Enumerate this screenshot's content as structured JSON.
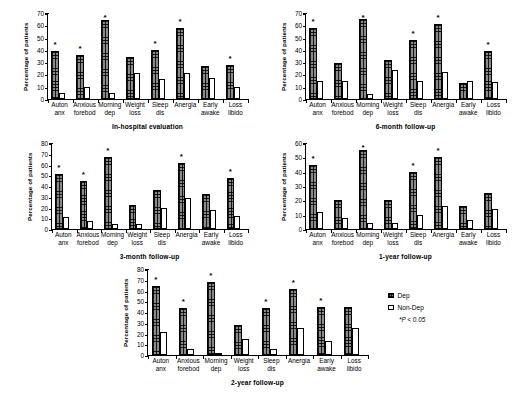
{
  "figure": {
    "ylabel": "Percentage of patients",
    "categories": [
      "Auton anx",
      "Anxious forebod",
      "Morning dep",
      "Weight loss",
      "Sleep dis",
      "Anergia",
      "Early awake",
      "Loss libido"
    ],
    "category_lines": [
      [
        "Auton",
        "anx"
      ],
      [
        "Anxious",
        "forebod"
      ],
      [
        "Morning",
        "dep"
      ],
      [
        "Weight",
        "loss"
      ],
      [
        "Sleep",
        "dis"
      ],
      [
        "Anergia",
        ""
      ],
      [
        "Early",
        "awake"
      ],
      [
        "Loss",
        "libido"
      ]
    ]
  },
  "legend": {
    "items": [
      {
        "label": "Dep",
        "swatch": "dep"
      },
      {
        "label": "Non-Dep",
        "swatch": "nondep"
      }
    ],
    "pnote_star": "*",
    "pnote_text": "P < 0.05"
  },
  "chart_data": [
    {
      "id": "in-hospital",
      "type": "bar",
      "title": "In-hospital evaluation",
      "xlabel": "In-hospital evaluation",
      "ylabel": "Percentage of patients",
      "ylim": [
        0,
        70
      ],
      "yticks": [
        0,
        10,
        20,
        30,
        40,
        50,
        60,
        70
      ],
      "grid": false,
      "categories": [
        "Auton anx",
        "Anxious forebod",
        "Morning dep",
        "Weight loss",
        "Sleep dis",
        "Anergia",
        "Early awake",
        "Loss libido"
      ],
      "series": [
        {
          "name": "Dep",
          "values": [
            39,
            36,
            64,
            34,
            40,
            58,
            27,
            28
          ]
        },
        {
          "name": "Non-Dep",
          "values": [
            5,
            10,
            5,
            21,
            16,
            21,
            17,
            10
          ]
        }
      ],
      "significant": [
        true,
        true,
        true,
        false,
        true,
        true,
        false,
        true
      ]
    },
    {
      "id": "6-month",
      "type": "bar",
      "title": "6-month follow-up",
      "xlabel": "6-month follow-up",
      "ylabel": "Percentage of patients",
      "ylim": [
        0,
        70
      ],
      "yticks": [
        0,
        10,
        20,
        30,
        40,
        50,
        60,
        70
      ],
      "grid": false,
      "categories": [
        "Auton anx",
        "Anxious forebod",
        "Morning dep",
        "Weight loss",
        "Sleep dis",
        "Anergia",
        "Early awake",
        "Loss libido"
      ],
      "series": [
        {
          "name": "Dep",
          "values": [
            58,
            29,
            65,
            32,
            48,
            61,
            13,
            39
          ]
        },
        {
          "name": "Non-Dep",
          "values": [
            15,
            15,
            4,
            24,
            15,
            22,
            15,
            14
          ]
        }
      ],
      "significant": [
        true,
        false,
        true,
        false,
        true,
        true,
        false,
        true
      ]
    },
    {
      "id": "3-month",
      "type": "bar",
      "title": "3-month follow-up",
      "xlabel": "3-month follow-up",
      "ylabel": "Percentage of patients",
      "ylim": [
        0,
        80
      ],
      "yticks": [
        0,
        10,
        20,
        30,
        40,
        50,
        60,
        70,
        80
      ],
      "grid": false,
      "categories": [
        "Auton anx",
        "Anxious forebod",
        "Morning dep",
        "Weight loss",
        "Sleep dis",
        "Anergia",
        "Early awake",
        "Loss libido"
      ],
      "series": [
        {
          "name": "Dep",
          "values": [
            51,
            45,
            67,
            22,
            36,
            61,
            33,
            47
          ]
        },
        {
          "name": "Non-Dep",
          "values": [
            11,
            7,
            5,
            5,
            20,
            29,
            18,
            12
          ]
        }
      ],
      "significant": [
        true,
        true,
        true,
        false,
        false,
        true,
        false,
        true
      ]
    },
    {
      "id": "1-year",
      "type": "bar",
      "title": "1-year follow-up",
      "xlabel": "1-year follow-up",
      "ylabel": "Percentage of patients",
      "ylim": [
        0,
        60
      ],
      "yticks": [
        0,
        10,
        20,
        30,
        40,
        50,
        60
      ],
      "grid": false,
      "categories": [
        "Auton anx",
        "Anxious forebod",
        "Morning dep",
        "Weight loss",
        "Sleep dis",
        "Anergia",
        "Early awake",
        "Loss libido"
      ],
      "series": [
        {
          "name": "Dep",
          "values": [
            45,
            20,
            55,
            20,
            40,
            50,
            16,
            25
          ]
        },
        {
          "name": "Non-Dep",
          "values": [
            12,
            8,
            4,
            4,
            10,
            16,
            6,
            14
          ]
        }
      ],
      "significant": [
        true,
        false,
        true,
        false,
        true,
        true,
        false,
        false
      ]
    },
    {
      "id": "2-year",
      "type": "bar",
      "title": "2-year follow-up",
      "xlabel": "2-year follow-up",
      "ylabel": "Percentage of patients",
      "ylim": [
        0,
        80
      ],
      "yticks": [
        0,
        10,
        20,
        30,
        40,
        50,
        60,
        70,
        80
      ],
      "grid": false,
      "categories": [
        "Auton anx",
        "Anxious forebod",
        "Morning dep",
        "Weight loss",
        "Sleep dis",
        "Anergia",
        "Early awake",
        "Loss libido"
      ],
      "series": [
        {
          "name": "Dep",
          "values": [
            64,
            44,
            68,
            28,
            44,
            61,
            45,
            45
          ]
        },
        {
          "name": "Non-Dep",
          "values": [
            21,
            6,
            0,
            15,
            6,
            25,
            13,
            25
          ]
        }
      ],
      "significant": [
        true,
        true,
        true,
        false,
        true,
        true,
        true,
        false
      ]
    }
  ]
}
